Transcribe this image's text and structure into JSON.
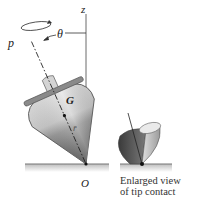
{
  "diagram": {
    "labels": {
      "z_axis": "z",
      "spin_rate": "p",
      "angle": "θ",
      "center_of_mass": "G",
      "position_vector": "r̄",
      "contact_point": "O"
    },
    "caption": {
      "line1": "Enlarged view",
      "line2": "of tip contact"
    },
    "colors": {
      "background": "#ffffff",
      "line": "#333333",
      "ground": "#888888",
      "top_light": "#d8d8d8",
      "top_mid": "#a8a8a8",
      "top_dark": "#555555"
    }
  }
}
